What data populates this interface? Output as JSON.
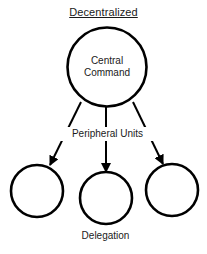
{
  "diagram": {
    "title": "Decentralized",
    "background_color": "#ffffff",
    "stroke_color": "#000000",
    "text_color": "#1a1a1a",
    "central_node": {
      "label_line_1": "Central",
      "label_line_2": "Command",
      "shape": "circle"
    },
    "edge_label": "Peripheral Units",
    "bottom_label": "Delegation",
    "child_nodes": [
      {
        "name": "child-node-left",
        "label": "",
        "shape": "circle"
      },
      {
        "name": "child-node-middle",
        "label": "",
        "shape": "circle"
      },
      {
        "name": "child-node-right",
        "label": "",
        "shape": "circle"
      }
    ],
    "arrows": [
      {
        "name": "arrow-to-left",
        "direction": "down-left"
      },
      {
        "name": "arrow-to-middle",
        "direction": "down"
      },
      {
        "name": "arrow-to-right",
        "direction": "down-right"
      }
    ]
  }
}
